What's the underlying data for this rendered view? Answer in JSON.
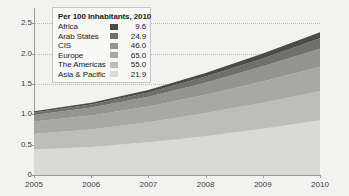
{
  "chart_data": {
    "type": "area",
    "stacked": true,
    "title": "",
    "xlabel": "",
    "ylabel": "",
    "x": [
      2005,
      2006,
      2007,
      2008,
      2009,
      2010
    ],
    "xtick_labels": [
      "2005",
      "2006",
      "2007",
      "2008",
      "2009",
      "2010"
    ],
    "ytick_labels": [
      "0",
      "0.5",
      "1.0",
      "1.5",
      "2.0",
      "2.5"
    ],
    "ytick_values": [
      0,
      0.5,
      1.0,
      1.5,
      2.0,
      2.5
    ],
    "ylim": [
      0,
      2.75
    ],
    "xlim": [
      2005,
      2010
    ],
    "grid": "dotted-horizontal",
    "legend_position": "top-left-inside",
    "series": [
      {
        "name": "Asia & Pacific",
        "color": "#d9d9d6",
        "values": [
          0.42,
          0.46,
          0.54,
          0.64,
          0.76,
          0.9
        ]
      },
      {
        "name": "The Americas",
        "color": "#bdbdba",
        "values": [
          0.26,
          0.29,
          0.33,
          0.38,
          0.43,
          0.48
        ]
      },
      {
        "name": "Europe",
        "color": "#a8a8a5",
        "values": [
          0.2,
          0.23,
          0.26,
          0.3,
          0.35,
          0.4
        ]
      },
      {
        "name": "CIS",
        "color": "#949491",
        "values": [
          0.11,
          0.13,
          0.16,
          0.2,
          0.25,
          0.3
        ]
      },
      {
        "name": "Arab States",
        "color": "#6f6f6c",
        "values": [
          0.04,
          0.05,
          0.07,
          0.1,
          0.13,
          0.17
        ]
      },
      {
        "name": "Africa",
        "color": "#4a4a47",
        "values": [
          0.02,
          0.03,
          0.04,
          0.06,
          0.08,
          0.1
        ]
      }
    ]
  },
  "legend": {
    "title": "Per 100 Inhabitants, 2010",
    "rows": [
      {
        "label": "Africa",
        "value": "9.6",
        "color": "#4a4a47"
      },
      {
        "label": "Arab States",
        "value": "24.9",
        "color": "#6f6f6c"
      },
      {
        "label": "CIS",
        "value": "46.0",
        "color": "#949491"
      },
      {
        "label": "Europe",
        "value": "65.0",
        "color": "#a8a8a5"
      },
      {
        "label": "The Americas",
        "value": "55.0",
        "color": "#bdbdba"
      },
      {
        "label": "Asia & Pacific",
        "value": "21.9",
        "color": "#d9d9d6"
      }
    ]
  },
  "colors": {
    "background": "#f2f2f0",
    "axis": "#9a9a98",
    "grid": "#b9b9b6",
    "text": "#1c1c1a"
  }
}
